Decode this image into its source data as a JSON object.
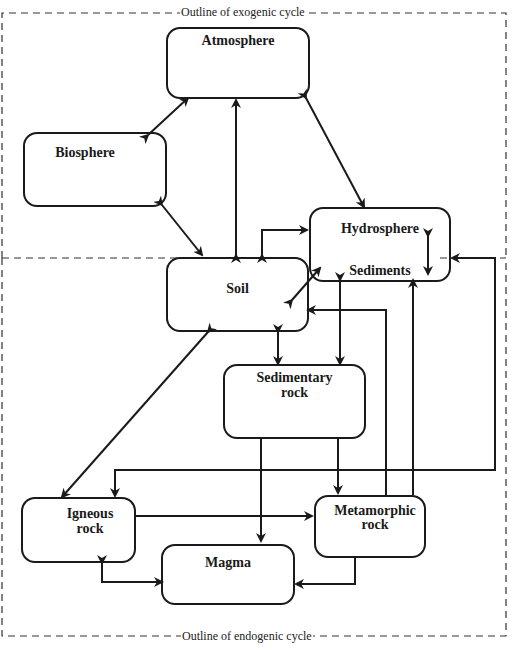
{
  "outlines": {
    "exogenic": "Outline of exogenic cycle",
    "endogenic": "Outline of endogenic cycle"
  },
  "nodes": {
    "atmosphere": "Atmosphere",
    "biosphere": "Biosphere",
    "hydrosphere": "Hydrosphere",
    "sediments": "Sediments",
    "soil": "Soil",
    "sedimentary_rock_1": "Sedimentary",
    "sedimentary_rock_2": "rock",
    "igneous_rock_1": "Igneous",
    "igneous_rock_2": "rock",
    "metamorphic_rock_1": "Metamorphic",
    "metamorphic_rock_2": "rock",
    "magma": "Magma"
  }
}
